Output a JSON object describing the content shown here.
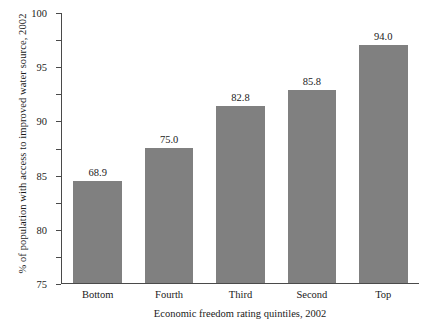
{
  "chart_data": {
    "type": "bar",
    "title": "",
    "categories": [
      "Bottom",
      "Fourth",
      "Third",
      "Second",
      "Top"
    ],
    "values": [
      68.9,
      75.0,
      82.8,
      85.8,
      94.0
    ],
    "value_labels": [
      "68.9",
      "75.0",
      "82.8",
      "85.8",
      "94.0"
    ],
    "xlabel": "Economic freedom rating quintiles, 2002",
    "ylabel": "% of population with access to improved water source, 2002",
    "ylim": [
      50,
      100
    ],
    "yticks": [
      50,
      55,
      60,
      65,
      70,
      75,
      80,
      85,
      90,
      95,
      100
    ],
    "ytick_labels": [
      "50",
      "55",
      "60",
      "65",
      "70",
      "75",
      "80",
      "85",
      "90",
      "95",
      "100"
    ],
    "grid": false,
    "legend": false,
    "bar_color": "#808080",
    "axis_color": "#4a4a4a",
    "background": "#ffffff"
  }
}
